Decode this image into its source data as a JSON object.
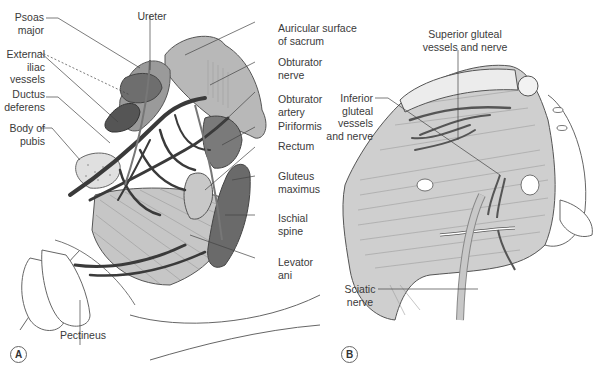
{
  "figure": {
    "panels": [
      {
        "id": "A",
        "letter": "A",
        "labels": {
          "psoas_major": [
            "Psoas",
            "major"
          ],
          "external_iliac_vessels": [
            "External",
            "iliac",
            "vessels"
          ],
          "ductus_deferens": [
            "Ductus",
            "deferens"
          ],
          "body_of_pubis": [
            "Body of",
            "pubis"
          ],
          "ureter": [
            "Ureter"
          ],
          "auricular_surface": [
            "Auricular surface",
            "of sacrum"
          ],
          "obturator_nerve": [
            "Obturator",
            "nerve"
          ],
          "obturator_artery": [
            "Obturator",
            "artery"
          ],
          "piriformis": [
            "Piriformis"
          ],
          "rectum": [
            "Rectum"
          ],
          "gluteus_maximus": [
            "Gluteus",
            "maximus"
          ],
          "ischial_spine": [
            "Ischial",
            "spine"
          ],
          "levator_ani": [
            "Levator",
            "ani"
          ],
          "pectineus": [
            "Pectineus"
          ]
        }
      },
      {
        "id": "B",
        "letter": "B",
        "labels": {
          "superior_gluteal": [
            "Superior gluteal",
            "vessels and nerve"
          ],
          "inferior_gluteal": [
            "Inferior",
            "gluteal",
            "vessels",
            "and nerve"
          ],
          "sciatic_nerve": [
            "Sciatic",
            "nerve"
          ]
        }
      }
    ],
    "colors": {
      "background": "#ffffff",
      "outline": "#555555",
      "light_fill": "#b4b4b4",
      "mid_fill": "#8c8c8c",
      "dark_fill": "#5a5a5a",
      "vessel": "#3c3c3c",
      "muscle_fill": "#cfcfcf",
      "leader_line": "#444444"
    }
  }
}
